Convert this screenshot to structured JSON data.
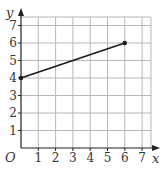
{
  "chart_data": {
    "type": "line",
    "title": "",
    "xlabel": "x",
    "ylabel": "y",
    "origin_label": "O",
    "xlim": [
      0,
      7
    ],
    "ylim": [
      0,
      7
    ],
    "x_ticks": [
      "1",
      "2",
      "3",
      "4",
      "5",
      "6",
      "7"
    ],
    "y_ticks": [
      "1",
      "2",
      "3",
      "4",
      "5",
      "6",
      "7"
    ],
    "grid": true,
    "legend": null,
    "series": [
      {
        "name": "segment",
        "x": [
          0,
          6
        ],
        "y": [
          4,
          6
        ],
        "endpoints_marked": true
      }
    ]
  },
  "style": {
    "axis_color": "#222222",
    "grid_color": "#b8b8b8",
    "line_color": "#1a1a1a",
    "text_color": "#333333"
  }
}
